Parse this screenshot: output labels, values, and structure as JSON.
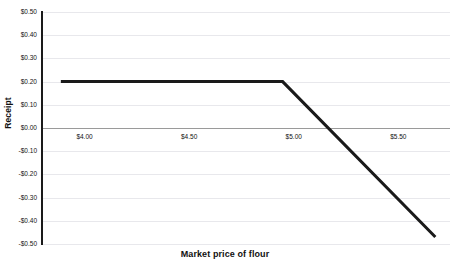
{
  "chart_data": {
    "type": "line",
    "title": "",
    "xlabel": "Market price of flour",
    "ylabel": "Receipt",
    "xlim": [
      3.85,
      5.8
    ],
    "ylim": [
      -0.5,
      0.5
    ],
    "grid": true,
    "legend": false,
    "x_tick_labels": [
      "$4.00",
      "$4.50",
      "$5.00",
      "$5.50"
    ],
    "x_tick_values": [
      4.0,
      4.5,
      5.0,
      5.5
    ],
    "y_tick_labels": [
      "$0.50",
      "$0.40",
      "$0.30",
      "$0.20",
      "$0.10",
      "$0.00",
      "-$0.10",
      "-$0.20",
      "-$0.30",
      "-$0.40",
      "-$0.50"
    ],
    "y_tick_values": [
      0.5,
      0.4,
      0.3,
      0.2,
      0.1,
      0.0,
      -0.1,
      -0.2,
      -0.3,
      -0.4,
      -0.5
    ],
    "series": [
      {
        "name": "Receipt",
        "color": "#1a1a1a",
        "x": [
          3.94,
          5.0,
          5.73
        ],
        "values": [
          0.2,
          0.2,
          -0.47
        ]
      }
    ],
    "annotations": []
  },
  "axes": {
    "y_title": "Receipt",
    "x_title": "Market price of flour",
    "zero_line_value": "$0.00"
  }
}
